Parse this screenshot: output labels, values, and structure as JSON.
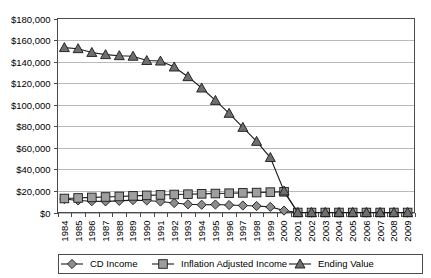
{
  "chart_data": {
    "type": "line",
    "title": "",
    "xlabel": "",
    "ylabel": "",
    "ylim": [
      0,
      180000
    ],
    "ytick_labels": [
      "$0",
      "$20,000",
      "$40,000",
      "$60,000",
      "$80,000",
      "$100,000",
      "$120,000",
      "$140,000",
      "$160,000",
      "$180,000"
    ],
    "ytick_values": [
      0,
      20000,
      40000,
      60000,
      80000,
      100000,
      120000,
      140000,
      160000,
      180000
    ],
    "grid": true,
    "legend_position": "bottom",
    "categories": [
      "1984",
      "1985",
      "1986",
      "1987",
      "1988",
      "1989",
      "1990",
      "1991",
      "1992",
      "1993",
      "1994",
      "1995",
      "1996",
      "1997",
      "1998",
      "1999",
      "2000",
      "2001",
      "2002",
      "2003",
      "2004",
      "2005",
      "2006",
      "2007",
      "2008",
      "2009"
    ],
    "series": [
      {
        "name": "CD Income",
        "marker": "diamond",
        "color": "#8c8c8c",
        "values": [
          12500,
          11200,
          10500,
          10300,
          10800,
          11500,
          11200,
          10200,
          8800,
          7600,
          7200,
          7400,
          6900,
          6500,
          6000,
          5200,
          1800,
          0,
          0,
          0,
          0,
          0,
          0,
          0,
          0,
          0
        ]
      },
      {
        "name": "Inflation Adjusted Income",
        "marker": "square",
        "color": "#9e9e9e",
        "values": [
          13000,
          13500,
          14000,
          14400,
          14900,
          15400,
          15900,
          16300,
          16700,
          17000,
          17300,
          17600,
          17900,
          18200,
          18500,
          18900,
          19200,
          0,
          0,
          0,
          0,
          0,
          0,
          0,
          0,
          0
        ]
      },
      {
        "name": "Ending Value",
        "marker": "triangle",
        "color": "#6e6e6e",
        "values": [
          153000,
          152000,
          148500,
          146500,
          145500,
          145000,
          141000,
          140500,
          135000,
          126000,
          115500,
          104000,
          92000,
          79000,
          66000,
          51000,
          20000,
          0,
          0,
          0,
          0,
          0,
          0,
          0,
          0,
          0
        ]
      }
    ]
  },
  "legend": {
    "items": [
      {
        "label": "CD Income"
      },
      {
        "label": "Inflation Adjusted Income"
      },
      {
        "label": "Ending Value"
      }
    ]
  }
}
